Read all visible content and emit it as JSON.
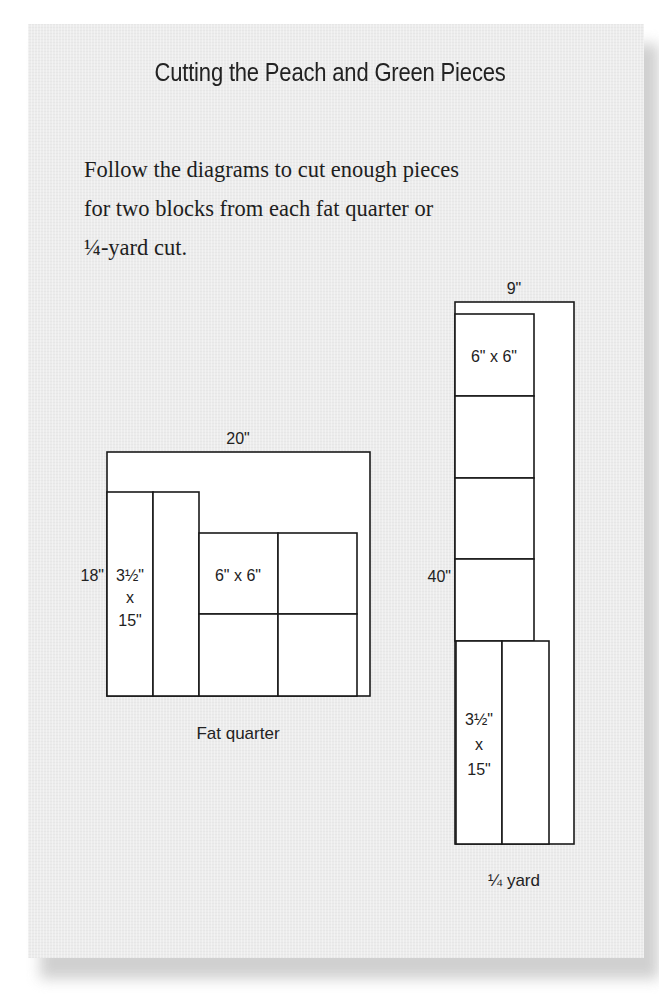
{
  "heading": "Cutting the Peach and Green Pieces",
  "instructions": {
    "lines": [
      "Follow the diagrams to cut enough pieces",
      "for two blocks from each fat quarter or",
      "¼-yard cut."
    ]
  },
  "fat_quarter": {
    "caption": "Fat quarter",
    "width_label": "20\"",
    "height_label": "18\"",
    "strip_label": [
      "3½\"",
      "x",
      "15\""
    ],
    "square_label": "6\" x 6\"",
    "strip_count": 2,
    "square_count": 4
  },
  "quarter_yard": {
    "caption": "¼ yard",
    "width_label": "9\"",
    "height_label": "40\"",
    "square_label": "6\" x 6\"",
    "strip_label": [
      "3½\"",
      "x",
      "15\""
    ],
    "square_count": 4,
    "strip_count": 2
  },
  "colors": {
    "card_bg": "#ececec",
    "piece_fill": "#ffffff",
    "line": "#1a1a1a",
    "text": "#222222"
  }
}
